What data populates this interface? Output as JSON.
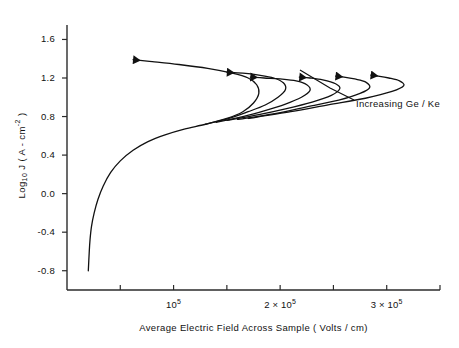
{
  "chart_data": {
    "type": "line",
    "title": "",
    "xlabel": "Average Electric Field Across Sample ( Volts / cm)",
    "ylabel_parts": {
      "prefix": "Log",
      "sub": "10",
      "suffix": " J ( A - cm",
      "sup": "-2",
      "tail": " )"
    },
    "ylabel": "Log10 J ( A - cm-2 )",
    "xlim": [
      0,
      350000
    ],
    "ylim": [
      -1.0,
      1.75
    ],
    "grid": false,
    "legend": null,
    "annotations": [
      {
        "text": "Increasing Ge / Ke",
        "x": 300000,
        "y": 0.75
      }
    ],
    "yticks": [
      {
        "value": 1.6,
        "label": "1.6"
      },
      {
        "value": 1.2,
        "label": "1.2"
      },
      {
        "value": 0.8,
        "label": "0.8"
      },
      {
        "value": 0.4,
        "label": "0.4"
      },
      {
        "value": 0.0,
        "label": "0.0"
      },
      {
        "value": -0.4,
        "label": "-0.4"
      },
      {
        "value": -0.8,
        "label": "-0.8"
      }
    ],
    "xticks": [
      {
        "value": 50000,
        "label": "",
        "mantissa": "",
        "exponent": ""
      },
      {
        "value": 100000,
        "label": "10^5",
        "mantissa": "10",
        "exponent": "5"
      },
      {
        "value": 150000,
        "label": "",
        "mantissa": "",
        "exponent": ""
      },
      {
        "value": 200000,
        "label": "2 x 10^5",
        "mantissa": "2 × 10",
        "exponent": "5"
      },
      {
        "value": 250000,
        "label": "",
        "mantissa": "",
        "exponent": ""
      },
      {
        "value": 300000,
        "label": "3 x 10^5",
        "mantissa": "3 × 10",
        "exponent": "5"
      },
      {
        "value": 350000,
        "label": "",
        "mantissa": "",
        "exponent": ""
      }
    ],
    "series": [
      {
        "name": "curve-1",
        "comment": "lowest Ge/Ke ratio, S-shaped negative-differential-resistance curve, turning point near 1.8e5",
        "points": [
          [
            20000,
            -0.8
          ],
          [
            20800,
            -0.62
          ],
          [
            21600,
            -0.48
          ],
          [
            23000,
            -0.34
          ],
          [
            25500,
            -0.2
          ],
          [
            29000,
            -0.06
          ],
          [
            34000,
            0.08
          ],
          [
            41000,
            0.22
          ],
          [
            50000,
            0.34
          ],
          [
            62000,
            0.45
          ],
          [
            76000,
            0.54
          ],
          [
            92000,
            0.61
          ],
          [
            110000,
            0.67
          ],
          [
            130000,
            0.72
          ],
          [
            150000,
            0.78
          ],
          [
            165000,
            0.85
          ],
          [
            175000,
            0.94
          ],
          [
            180000,
            1.04
          ],
          [
            178000,
            1.13
          ],
          [
            170000,
            1.2
          ],
          [
            155000,
            1.25
          ],
          [
            132000,
            1.3
          ],
          [
            105000,
            1.34
          ],
          [
            80000,
            1.37
          ],
          [
            62000,
            1.39
          ]
        ],
        "arrow_at": [
          62000,
          1.39
        ]
      },
      {
        "name": "curve-2",
        "comment": "second curve, turning point near 2.05e5",
        "points": [
          [
            130000,
            0.72
          ],
          [
            152000,
            0.78
          ],
          [
            170000,
            0.85
          ],
          [
            186000,
            0.92
          ],
          [
            198000,
            1.0
          ],
          [
            205000,
            1.08
          ],
          [
            203000,
            1.15
          ],
          [
            194000,
            1.2
          ],
          [
            180000,
            1.23
          ],
          [
            165000,
            1.25
          ],
          [
            150000,
            1.26
          ]
        ],
        "arrow_at": [
          150000,
          1.26
        ]
      },
      {
        "name": "curve-3",
        "comment": "third curve, turning point near 2.3e5",
        "points": [
          [
            140000,
            0.74
          ],
          [
            165000,
            0.8
          ],
          [
            185000,
            0.86
          ],
          [
            205000,
            0.93
          ],
          [
            220000,
            1.0
          ],
          [
            228000,
            1.07
          ],
          [
            225000,
            1.13
          ],
          [
            215000,
            1.17
          ],
          [
            200000,
            1.19
          ],
          [
            185000,
            1.2
          ],
          [
            172000,
            1.21
          ]
        ],
        "arrow_at": [
          172000,
          1.21
        ]
      },
      {
        "name": "curve-4",
        "comment": "fourth curve, turning point near 2.6e5",
        "points": [
          [
            150000,
            0.76
          ],
          [
            180000,
            0.82
          ],
          [
            205000,
            0.88
          ],
          [
            230000,
            0.95
          ],
          [
            248000,
            1.02
          ],
          [
            256000,
            1.09
          ],
          [
            252000,
            1.14
          ],
          [
            240000,
            1.18
          ],
          [
            228000,
            1.2
          ],
          [
            218000,
            1.21
          ]
        ],
        "arrow_at": [
          218000,
          1.21
        ]
      },
      {
        "name": "curve-5",
        "comment": "fifth curve, turning point near 2.9e5",
        "points": [
          [
            160000,
            0.77
          ],
          [
            195000,
            0.83
          ],
          [
            225000,
            0.9
          ],
          [
            255000,
            0.97
          ],
          [
            275000,
            1.04
          ],
          [
            284000,
            1.1
          ],
          [
            280000,
            1.16
          ],
          [
            270000,
            1.19
          ],
          [
            260000,
            1.21
          ],
          [
            252000,
            1.22
          ]
        ],
        "arrow_at": [
          252000,
          1.22
        ]
      },
      {
        "name": "curve-6",
        "comment": "highest Ge/Ke ratio, turning point near 3.2e5",
        "points": [
          [
            170000,
            0.78
          ],
          [
            210000,
            0.85
          ],
          [
            245000,
            0.92
          ],
          [
            280000,
            0.99
          ],
          [
            305000,
            1.06
          ],
          [
            316000,
            1.12
          ],
          [
            312000,
            1.17
          ],
          [
            302000,
            1.2
          ],
          [
            292000,
            1.22
          ],
          [
            285000,
            1.23
          ]
        ],
        "arrow_at": [
          285000,
          1.23
        ]
      }
    ]
  },
  "axes": {
    "y_tick_labels": [
      "1.6",
      "1.2",
      "0.8",
      "0.4",
      "0.0",
      "-0.4",
      "-0.8"
    ],
    "x_tick_labels": [
      "10⁵",
      "2 × 10⁵",
      "3 × 10⁵"
    ],
    "x_title": "Average Electric Field Across Sample ( Volts / cm)"
  },
  "annotation": {
    "increasing": "Increasing  Ge / Ke"
  },
  "style": {
    "line_color": "#111111",
    "axis_color": "#2b2b2b",
    "background": "#ffffff"
  }
}
